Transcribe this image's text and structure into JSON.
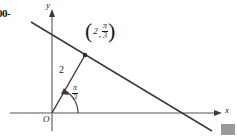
{
  "figure": {
    "type": "polar-line-diagram",
    "width": 237,
    "height": 138,
    "background_color": "#ffffff",
    "ink_color": "#1a1a1a",
    "axis_color": "#808080"
  },
  "axes": {
    "y_label": "y",
    "x_label": "x",
    "origin_label": "O",
    "origin_px": {
      "x": 52,
      "y": 113
    },
    "x_axis": {
      "start_px": {
        "x": 10,
        "y": 113
      },
      "end_px": {
        "x": 222,
        "y": 113
      },
      "arrow": true
    },
    "y_axis": {
      "start_px": {
        "x": 52,
        "y": 130
      },
      "end_px": {
        "x": 52,
        "y": 10
      },
      "arrow": true
    }
  },
  "line": {
    "name": "polar-line",
    "start_px": {
      "x": 31,
      "y": 22
    },
    "end_px": {
      "x": 212,
      "y": 131
    },
    "description": "straight line descending left-to-right, tangent-style line through the marked point"
  },
  "radius": {
    "label": "2",
    "from_px": {
      "x": 52,
      "y": 113
    },
    "to_px": {
      "x": 85,
      "y": 55
    },
    "label_px": {
      "x": 62,
      "y": 72
    }
  },
  "angle": {
    "numerator": "π",
    "denominator": "3",
    "label_px": {
      "x": 76,
      "y": 88
    },
    "arc_radius_px": 26,
    "arc_from_deg": 0,
    "arc_to_deg": 60,
    "arrow_at_end": true
  },
  "point": {
    "name": "marked-point",
    "px": {
      "x": 85,
      "y": 55
    },
    "label_open_paren": "(",
    "label_close_paren": ")",
    "label_r": "2",
    "label_comma": ",",
    "label_theta_numerator": "π",
    "label_theta_denominator": "3",
    "label_full": "(2, π/3)"
  },
  "artifacts": {
    "left_edge_text": "00-",
    "corner_box_color": "#9a9a9a"
  }
}
